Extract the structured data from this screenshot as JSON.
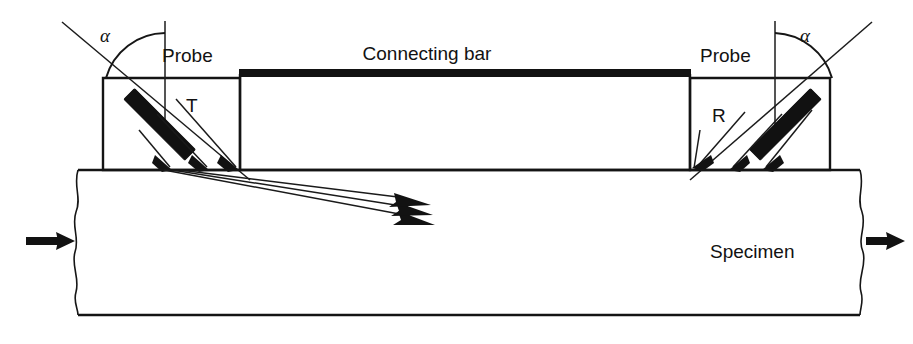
{
  "figure": {
    "background_color": "#ffffff",
    "line_color": "#141414",
    "fill_color": "#111111",
    "width": 913,
    "height": 344
  },
  "labels": {
    "probe_left": "Probe",
    "probe_right": "Probe",
    "connecting_bar": "Connecting bar",
    "specimen": "Specimen",
    "transmitter": "T",
    "receiver": "R",
    "angle_left": "α",
    "angle_right": "α"
  },
  "components": {
    "probe_left": {
      "name": "Probe",
      "marker": "T",
      "role": "transmitter",
      "box": {
        "x": 103,
        "y": 78,
        "width": 137,
        "height": 92
      }
    },
    "probe_right": {
      "name": "Probe",
      "marker": "R",
      "role": "receiver",
      "box": {
        "x": 690,
        "y": 78,
        "width": 140,
        "height": 92
      }
    },
    "connecting_bar": {
      "name": "Connecting bar",
      "box": {
        "x": 240,
        "y": 70,
        "width": 450,
        "height": 100
      },
      "top_edge_style": "thick-solid-black"
    },
    "specimen": {
      "name": "Specimen",
      "top_y": 170,
      "bottom_y": 315,
      "left_x": 78,
      "right_x": 860,
      "edge_style": "torn-wavy-ends"
    }
  },
  "annotations": {
    "angle_symbol": "α",
    "angle_description": "probe beam incidence angle measured from the surface normal",
    "load_arrow_left": "tensile load applied to left end of specimen",
    "load_arrow_right": "tensile load applied to right end of specimen",
    "beam_count": 3,
    "beam_direction_left": "down-right into specimen",
    "beam_direction_right": "up-right into receiver probe"
  }
}
